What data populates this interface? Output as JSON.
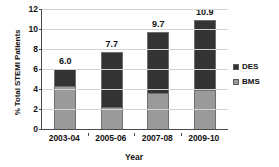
{
  "chart_data": {
    "type": "bar",
    "subtype": "stacked-bar",
    "title": "",
    "xlabel": "Year",
    "ylabel": "% Total STEMI Patients",
    "categories": [
      "2003-04",
      "2005-06",
      "2007-08",
      "2009-10"
    ],
    "series": [
      {
        "name": "BMS",
        "color": "#9a9a9a",
        "stack_order": 0,
        "values": [
          4.3,
          2.2,
          3.6,
          3.9
        ]
      },
      {
        "name": "DES",
        "color": "#333333",
        "stack_order": 1,
        "values": [
          1.7,
          5.5,
          6.1,
          7.0
        ]
      }
    ],
    "totals": [
      6.0,
      7.7,
      9.7,
      10.9
    ],
    "total_labels": [
      "6.0",
      "7.7",
      "9.7",
      "10.9"
    ],
    "ylim": [
      0,
      12
    ],
    "ytick_values": [
      0,
      2,
      4,
      6,
      8,
      10,
      12
    ],
    "ytick_labels": [
      "0",
      "2",
      "4",
      "6",
      "8",
      "10",
      "12"
    ],
    "grid": true,
    "grid_axis": "y",
    "legend_position": "right",
    "legend_entries": [
      "DES",
      "BMS"
    ]
  },
  "legend": {
    "items": [
      {
        "label": "DES",
        "color": "#333333"
      },
      {
        "label": "BMS",
        "color": "#9a9a9a"
      }
    ]
  },
  "colors": {
    "des": "#333333",
    "bms": "#9a9a9a",
    "gridline": "#d3d3d3",
    "axis": "#4a4a4a",
    "background": "#ffffff",
    "text": "#111111"
  }
}
